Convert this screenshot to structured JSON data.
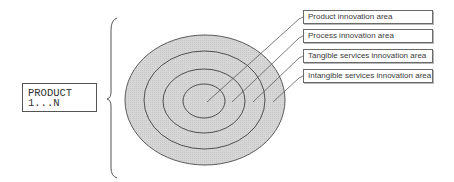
{
  "diagram": {
    "product_box": {
      "line1": "PRODUCT",
      "line2": "1...N"
    },
    "colors": {
      "ring_fill": "#d3d3d3",
      "ring_stroke": "#4a4a4a",
      "leader_stroke": "#5a5a5a",
      "brace_stroke": "#555555"
    },
    "rings": [
      {
        "name": "intangible-services",
        "cx": 205,
        "cy": 100,
        "rx": 80,
        "ry": 65
      },
      {
        "name": "tangible-services",
        "cx": 204,
        "cy": 100,
        "rx": 60,
        "ry": 49
      },
      {
        "name": "process",
        "cx": 204,
        "cy": 101,
        "rx": 41,
        "ry": 32
      },
      {
        "name": "product",
        "cx": 204,
        "cy": 101,
        "rx": 21,
        "ry": 17
      }
    ],
    "labels": [
      {
        "text": "Product innovation area",
        "top": 10
      },
      {
        "text": "Process innovation area",
        "top": 29
      },
      {
        "text": "Tangible services innovation area",
        "top": 49
      },
      {
        "text": "Intangible services innovation area",
        "top": 69
      }
    ]
  }
}
